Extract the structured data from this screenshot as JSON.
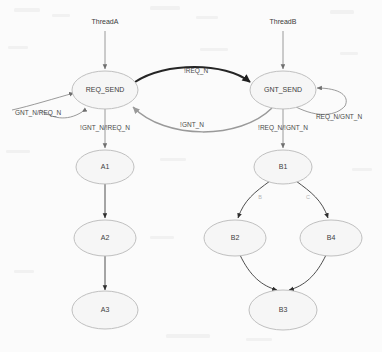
{
  "diagram": {
    "background_color": "#fbfbfb",
    "node_fill": "#f6f6f6",
    "node_stroke": "#b9b9b9",
    "accent_dark": "#252525",
    "accent_gray": "#9a9a9a"
  },
  "entry_points": [
    {
      "id": "threadA",
      "label": "ThreadA",
      "x": 105,
      "y": 22
    },
    {
      "id": "threadB",
      "label": "ThreadB",
      "x": 283,
      "y": 22
    }
  ],
  "nodes": [
    {
      "id": "req_send",
      "label": "REQ_SEND",
      "cx": 105,
      "cy": 90,
      "rx": 33,
      "ry": 19
    },
    {
      "id": "gnt_send",
      "label": "GNT_SEND",
      "cx": 283,
      "cy": 90,
      "rx": 33,
      "ry": 19
    },
    {
      "id": "a1",
      "label": "A1",
      "cx": 105,
      "cy": 167,
      "rx": 29,
      "ry": 17
    },
    {
      "id": "a2",
      "label": "A2",
      "cx": 105,
      "cy": 238,
      "rx": 31,
      "ry": 18
    },
    {
      "id": "a3",
      "label": "A3",
      "cx": 105,
      "cy": 310,
      "rx": 33,
      "ry": 19
    },
    {
      "id": "b1",
      "label": "B1",
      "cx": 283,
      "cy": 167,
      "rx": 29,
      "ry": 17
    },
    {
      "id": "b2",
      "label": "B2",
      "cx": 235,
      "cy": 238,
      "rx": 31,
      "ry": 18
    },
    {
      "id": "b4",
      "label": "B4",
      "cx": 331,
      "cy": 238,
      "rx": 31,
      "ry": 18
    },
    {
      "id": "b3",
      "label": "B3",
      "cx": 283,
      "cy": 310,
      "rx": 34,
      "ry": 20
    }
  ],
  "edges": [
    {
      "id": "threadA-to-req_send",
      "from": "threadA",
      "to": "req_send",
      "label": "",
      "style": "plain"
    },
    {
      "id": "threadB-to-gnt_send",
      "from": "threadB",
      "to": "gnt_send",
      "label": "",
      "style": "plain"
    },
    {
      "id": "req_send-to-gnt_send",
      "from": "req_send",
      "to": "gnt_send",
      "label": "!REQ_N",
      "style": "bold",
      "label_x": 196,
      "label_y": 71
    },
    {
      "id": "gnt_send-to-req_send",
      "from": "gnt_send",
      "to": "req_send",
      "label": "!GNT_N",
      "style": "gray",
      "label_x": 192,
      "label_y": 125
    },
    {
      "id": "req_send-self",
      "from": "req_send",
      "to": "req_send",
      "label": "GNT_N/REQ_N",
      "style": "plain",
      "label_x": 38,
      "label_y": 113
    },
    {
      "id": "gnt_send-self",
      "from": "gnt_send",
      "to": "gnt_send",
      "label": "REQ_N/GNT_N",
      "style": "plain",
      "label_x": 339,
      "label_y": 117
    },
    {
      "id": "req_send-to-a1",
      "from": "req_send",
      "to": "a1",
      "label": "!GNT_N/!REQ_N",
      "style": "plain",
      "label_x": 105,
      "label_y": 128
    },
    {
      "id": "gnt_send-to-b1",
      "from": "gnt_send",
      "to": "b1",
      "label": "!REQ_N/!GNT_N",
      "style": "plain",
      "label_x": 283,
      "label_y": 128
    },
    {
      "id": "a1-to-a2",
      "from": "a1",
      "to": "a2",
      "label": "",
      "style": "dark"
    },
    {
      "id": "a2-to-a3",
      "from": "a2",
      "to": "a3",
      "label": "",
      "style": "dark"
    },
    {
      "id": "b1-to-b2",
      "from": "b1",
      "to": "b2",
      "label": "B",
      "style": "dark",
      "label_x": 260,
      "label_y": 198
    },
    {
      "id": "b1-to-b4",
      "from": "b1",
      "to": "b4",
      "label": "C",
      "style": "dark",
      "label_x": 308,
      "label_y": 198
    },
    {
      "id": "b2-to-b3",
      "from": "b2",
      "to": "b3",
      "label": "",
      "style": "dark"
    },
    {
      "id": "b4-to-b3",
      "from": "b4",
      "to": "b3",
      "label": "",
      "style": "dark"
    }
  ]
}
